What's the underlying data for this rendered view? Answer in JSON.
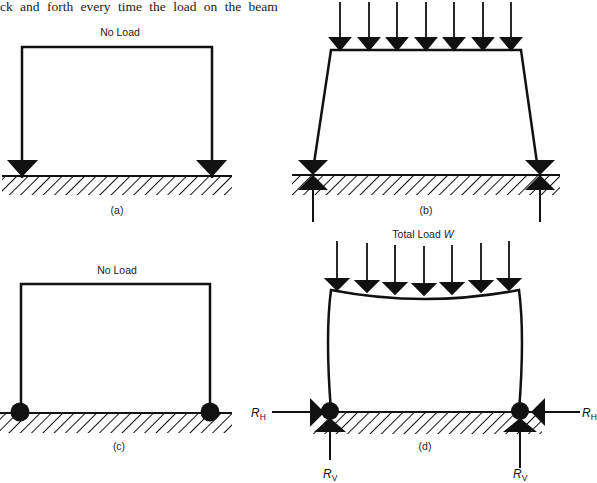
{
  "intro_text": {
    "line1": "y  p    p              y",
    "line2": "ck and forth every time the load on the beam"
  },
  "panels": {
    "a": {
      "title": "No Load",
      "caption": "(a)",
      "support_type": "pin-arrow"
    },
    "b": {
      "title": "",
      "caption": "(b)",
      "load_arrows": 7,
      "support_type": "pin-with-reaction"
    },
    "c": {
      "title": "No Load",
      "caption": "(c)",
      "support_type": "hinge-circle"
    },
    "d": {
      "title": "Total Load W",
      "title_main": "Total Load ",
      "title_symbol": "W",
      "caption": "(d)",
      "load_arrows": 7,
      "reactions": {
        "horizontal_left": {
          "symbol": "R",
          "sub": "H"
        },
        "horizontal_right": {
          "symbol": "R",
          "sub": "H"
        },
        "vertical_left": {
          "symbol": "R",
          "sub": "V"
        },
        "vertical_right": {
          "symbol": "R",
          "sub": "V"
        }
      }
    }
  },
  "colors": {
    "ink": "#111111",
    "background": "#ffffff"
  }
}
